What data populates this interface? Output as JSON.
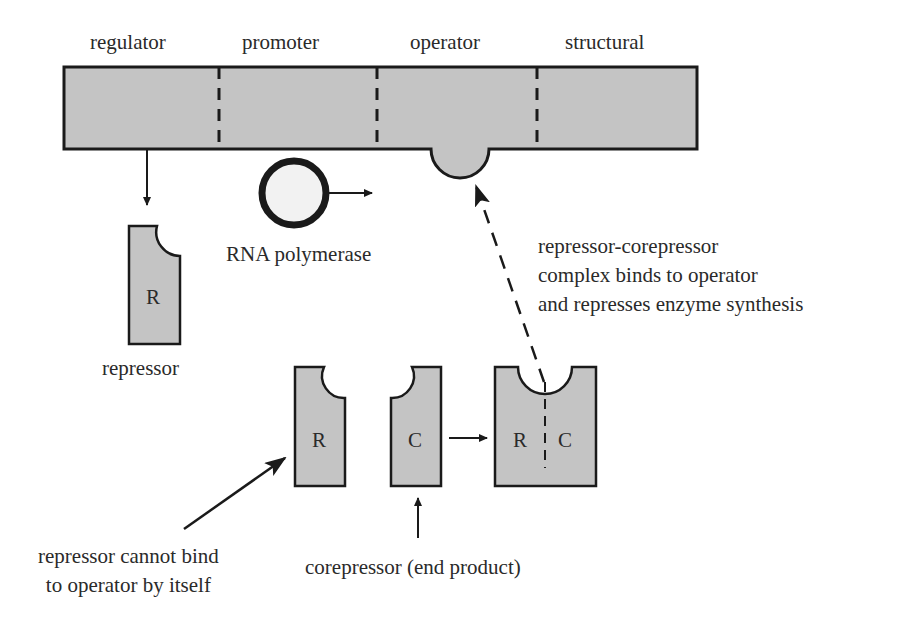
{
  "diagram": {
    "colors": {
      "fill": "#c4c4c4",
      "stroke": "#1a1a1a",
      "polymerase_fill": "#f2f2f2",
      "background": "#ffffff"
    },
    "dna_segments": [
      {
        "label": "regulator"
      },
      {
        "label": "promoter"
      },
      {
        "label": "operator"
      },
      {
        "label": "structural"
      }
    ],
    "shapes": {
      "repressor_alone": {
        "letter": "R",
        "label": "repressor"
      },
      "rna_polymerase": {
        "label": "RNA polymerase"
      },
      "repressor_inactive": {
        "letter": "R"
      },
      "corepressor": {
        "letter": "C"
      },
      "complex": {
        "letter_left": "R",
        "letter_right": "C"
      }
    },
    "annotations": {
      "complex_note": "repressor-corepressor\ncomplex binds to operator\nand represses enzyme synthesis",
      "cannot_bind_note": "repressor cannot bind\nto operator by itself",
      "corepressor_note": "corepressor (end product)"
    }
  }
}
